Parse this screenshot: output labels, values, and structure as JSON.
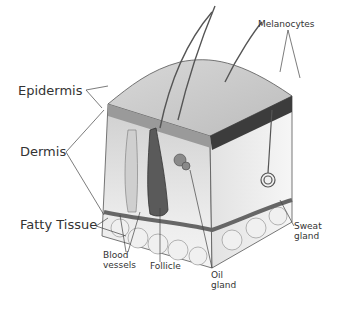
{
  "diagram": {
    "labels": {
      "epidermis": "Epidermis",
      "dermis": "Dermis",
      "fatty_tissue": "Fatty Tissue",
      "melanocytes": "Melanocytes",
      "blood_vessels_1": "Blood",
      "blood_vessels_2": "vessels",
      "follicle": "Follicle",
      "oil_gland_1": "Oil",
      "oil_gland_2": "gland",
      "sweat_gland_1": "Sweat",
      "sweat_gland_2": "gland"
    },
    "colors": {
      "line": "#444444",
      "label": "#333333",
      "skin_light": "#e6e6e6",
      "skin_dark": "#555555"
    }
  }
}
